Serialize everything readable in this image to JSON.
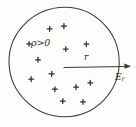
{
  "figure": {
    "kind": "physics-sketch",
    "background_color": "#fdfdfc",
    "ink_color": "#3b3b3b",
    "labels": {
      "charge_density": "ρ>0",
      "radius": "r",
      "field_symbol": "E",
      "field_subscript": "r"
    },
    "circle": {
      "center_x": 64,
      "center_y": 62,
      "radius": 55,
      "stroke_color": "#3b3b3b",
      "stroke_width": 1.05
    },
    "arrow": {
      "start_x": 64,
      "start_y": 67,
      "end_x": 131,
      "end_y": 67,
      "stroke_color": "#3a3a3a",
      "head_length": 6
    },
    "label_positions": {
      "charge_density": {
        "x": 31,
        "y": 38
      },
      "radius": {
        "x": 84,
        "y": 53
      },
      "field": {
        "x": 115,
        "y": 73
      }
    },
    "charges": [
      {
        "x": 50,
        "y": 29,
        "size": 5.0
      },
      {
        "x": 64,
        "y": 26,
        "size": 5.2
      },
      {
        "x": 29,
        "y": 44,
        "size": 4.6
      },
      {
        "x": 86,
        "y": 44,
        "size": 4.8
      },
      {
        "x": 66,
        "y": 49,
        "size": 4.6
      },
      {
        "x": 38,
        "y": 60,
        "size": 4.8
      },
      {
        "x": 31,
        "y": 79,
        "size": 4.8
      },
      {
        "x": 52,
        "y": 74,
        "size": 5.2
      },
      {
        "x": 55,
        "y": 89,
        "size": 4.8
      },
      {
        "x": 76,
        "y": 87,
        "size": 4.8
      },
      {
        "x": 90,
        "y": 83,
        "size": 4.8
      },
      {
        "x": 63,
        "y": 101,
        "size": 4.8
      },
      {
        "x": 83,
        "y": 102,
        "size": 4.8
      }
    ]
  }
}
